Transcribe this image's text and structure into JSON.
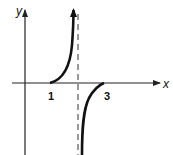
{
  "diagram": {
    "type": "function-graph",
    "axes": {
      "x_label": "x",
      "y_label": "y"
    },
    "x_ticks": [
      {
        "label": "1",
        "value": 1
      },
      {
        "label": "3",
        "value": 3
      }
    ],
    "asymptote": {
      "type": "vertical",
      "style": "dashed",
      "x": 2
    },
    "branches": [
      {
        "name": "left-branch",
        "from": "x-intercept 1",
        "to": "+infinity near asymptote",
        "arrow": "up"
      },
      {
        "name": "right-branch",
        "from": "-infinity near asymptote",
        "to": "x-intercept 3"
      }
    ],
    "colors": {
      "curve": "#111111",
      "axes": "#222222",
      "background": "#ffffff"
    }
  }
}
